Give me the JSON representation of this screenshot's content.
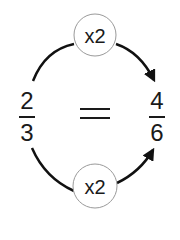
{
  "diagram": {
    "top_operator": "x2",
    "bottom_operator": "x2",
    "left_fraction": {
      "numerator": "2",
      "denominator": "3"
    },
    "equals": "=",
    "right_fraction": {
      "numerator": "4",
      "denominator": "6"
    },
    "colors": {
      "stroke": "#111111",
      "circle_stroke": "#9a9a9a",
      "background": "#ffffff"
    }
  }
}
